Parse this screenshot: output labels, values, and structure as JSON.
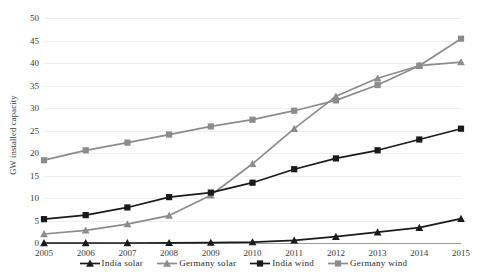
{
  "chart_data": {
    "type": "line",
    "title": "",
    "xlabel": "",
    "ylabel": "GW installed capacity",
    "categories": [
      "2005",
      "2006",
      "2007",
      "2008",
      "2009",
      "2010",
      "2011",
      "2012",
      "2013",
      "2014",
      "2015"
    ],
    "xlim": [
      2005,
      2015
    ],
    "ylim": [
      0,
      50
    ],
    "yticks": [
      0,
      5,
      10,
      15,
      20,
      25,
      30,
      35,
      40,
      45,
      50
    ],
    "ytick_labels": [
      "0",
      "5",
      "10",
      "15",
      "20",
      "25",
      "30",
      "35",
      "40",
      "45",
      "50"
    ],
    "grid": true,
    "legend_position": "bottom-center",
    "series": [
      {
        "name": "India solar",
        "color": "#1a1a1a",
        "marker": "triangle",
        "values": [
          0.0,
          0.0,
          0.0,
          0.05,
          0.1,
          0.2,
          0.6,
          1.4,
          2.4,
          3.4,
          5.4
        ]
      },
      {
        "name": "Germany solar",
        "color": "#8c8c8c",
        "marker": "triangle",
        "values": [
          2.0,
          2.8,
          4.2,
          6.1,
          10.6,
          17.6,
          25.4,
          32.6,
          36.6,
          39.4,
          40.2
        ]
      },
      {
        "name": "India wind",
        "color": "#1a1a1a",
        "marker": "square",
        "values": [
          5.3,
          6.2,
          7.9,
          10.2,
          11.2,
          13.4,
          16.4,
          18.8,
          20.6,
          23.0,
          25.4
        ]
      },
      {
        "name": "Germany wind",
        "color": "#8c8c8c",
        "marker": "square",
        "values": [
          18.4,
          20.6,
          22.3,
          24.1,
          25.9,
          27.4,
          29.4,
          31.7,
          35.1,
          39.4,
          45.4
        ]
      }
    ]
  },
  "legend": {
    "items": [
      {
        "label": "India solar"
      },
      {
        "label": "Germany solar"
      },
      {
        "label": "India wind"
      },
      {
        "label": "Germany wind"
      }
    ]
  },
  "colors": {
    "india": "#1a1a1a",
    "germany": "#8c8c8c",
    "gridline": "#efefef",
    "axis": "#9a9a9a",
    "background": "#ffffff"
  }
}
